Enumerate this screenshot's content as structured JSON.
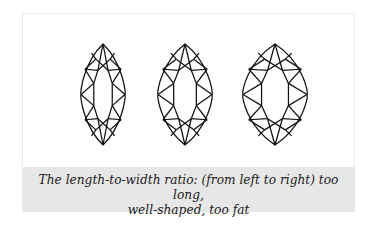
{
  "figure": {
    "diamonds": [
      {
        "label": "too long",
        "cx": 103,
        "top": 44,
        "bottom": 145,
        "halfWidth": 22
      },
      {
        "label": "well-shaped",
        "cx": 185,
        "top": 44,
        "bottom": 145,
        "halfWidth": 27
      },
      {
        "label": "too fat",
        "cx": 275,
        "top": 44,
        "bottom": 145,
        "halfWidth": 32
      }
    ],
    "stroke_color": "#111111",
    "caption_bg": "#e7e7e7"
  },
  "caption": {
    "line1": "The length-to-width ratio: (from left to right) too long,",
    "line2": "well-shaped, too fat"
  }
}
